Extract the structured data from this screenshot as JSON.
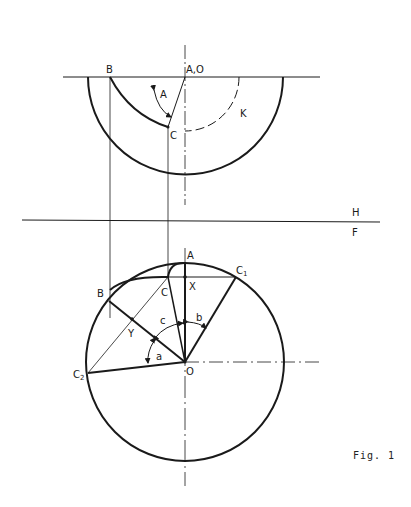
{
  "figure": {
    "caption": "Fig. 1",
    "plane_labels": {
      "upper": "H",
      "lower": "F"
    }
  },
  "top_view": {
    "labels": {
      "B": "B",
      "AO": "A,O",
      "angle_A": "A",
      "C": "C",
      "K": "K"
    }
  },
  "front_view": {
    "labels": {
      "A": "A",
      "X": "X",
      "C1": "C",
      "C1_sub": "1",
      "B": "B",
      "C": "C",
      "Y": "Y",
      "angle_c": "c",
      "angle_b": "b",
      "angle_a": "a",
      "O": "O",
      "C2": "C",
      "C2_sub": "2"
    }
  },
  "colors": {
    "ink": "#1a1a1a",
    "background": "#ffffff"
  }
}
